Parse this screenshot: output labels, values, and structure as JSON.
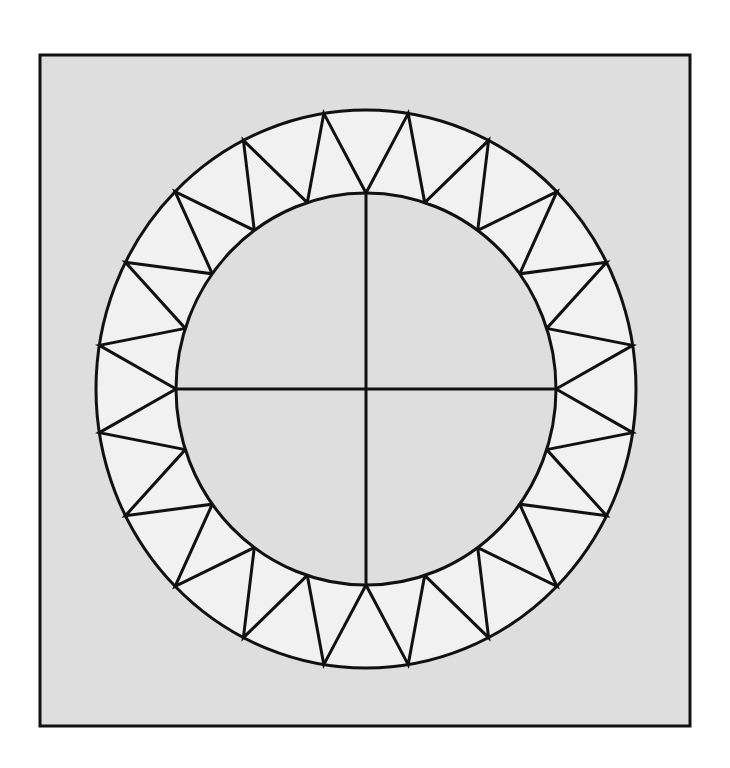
{
  "canvas": {
    "width": 730,
    "height": 768,
    "background": "#ffffff"
  },
  "frame": {
    "x": 40,
    "y": 55,
    "width": 650,
    "height": 671,
    "fill": "#dedede",
    "stroke": "#111111",
    "stroke_width": 3
  },
  "ring": {
    "cx": 366,
    "cy": 389,
    "outer_rx": 270,
    "outer_ry": 279,
    "inner_rx": 190,
    "inner_ry": 196,
    "band_fill": "#f1f1f1",
    "inner_fill": "#dedede",
    "stroke": "#111111",
    "stroke_width": 3
  },
  "zigzag": {
    "inner_vertex_count": 20,
    "outer_vertex_count": 20,
    "triangle_count": 40,
    "inner_start_angle_deg": 0,
    "outer_offset_deg": 9
  },
  "cross": {
    "horizontal": true,
    "vertical": true
  }
}
